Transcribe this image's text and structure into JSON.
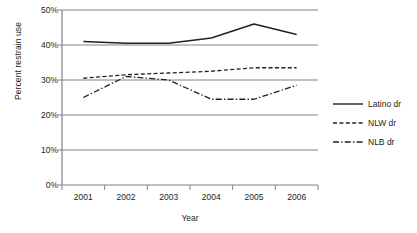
{
  "chart_data": {
    "type": "line",
    "title": "",
    "xlabel": "Year",
    "ylabel": "Percent restrain use",
    "categories": [
      "2001",
      "2002",
      "2003",
      "2004",
      "2005",
      "2006"
    ],
    "ylim": [
      0,
      50
    ],
    "ytick_labels": [
      "0%",
      "10%",
      "20%",
      "30%",
      "40%",
      "50%"
    ],
    "ytick_values": [
      0,
      10,
      20,
      30,
      40,
      50
    ],
    "grid": true,
    "grid_axis": "y",
    "legend_position": "right",
    "series": [
      {
        "name": "Latino dr",
        "style": "solid",
        "color": "#231f20",
        "values": [
          41.0,
          40.5,
          40.5,
          42.0,
          46.0,
          43.0
        ]
      },
      {
        "name": "NLW dr",
        "style": "dashed",
        "color": "#231f20",
        "values": [
          30.5,
          31.5,
          32.0,
          32.5,
          33.5,
          33.5
        ]
      },
      {
        "name": "NLB dr",
        "style": "dashdot",
        "color": "#231f20",
        "values": [
          25.0,
          31.0,
          30.0,
          24.5,
          24.5,
          28.5
        ]
      }
    ]
  },
  "axes": {
    "y_title": "Percent restrain use",
    "x_title": "Year",
    "y_labels": {
      "t0": "0%",
      "t10": "10%",
      "t20": "20%",
      "t30": "30%",
      "t40": "40%",
      "t50": "50%"
    },
    "x_labels": {
      "c0": "2001",
      "c1": "2002",
      "c2": "2003",
      "c3": "2004",
      "c4": "2005",
      "c5": "2006"
    }
  },
  "legend": {
    "items": [
      {
        "label": "Latino dr",
        "style": "solid"
      },
      {
        "label": "NLW dr",
        "style": "dashed"
      },
      {
        "label": "NLB dr",
        "style": "dashdot"
      }
    ]
  },
  "colors": {
    "line": "#231f20",
    "grid": "#808285",
    "axis": "#808285",
    "background": "#ffffff"
  }
}
